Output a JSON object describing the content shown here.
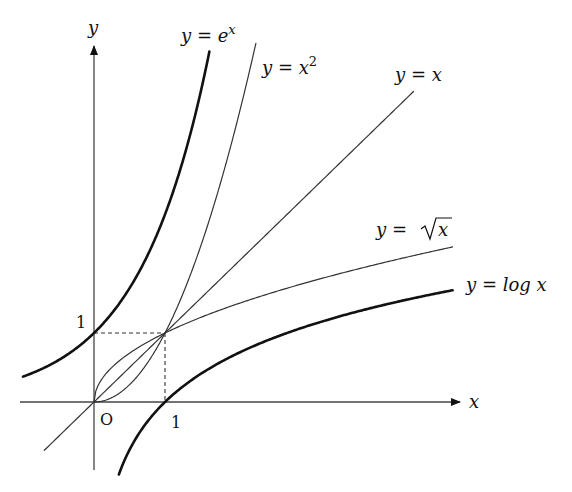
{
  "diagram": {
    "colors": {
      "axis": "#444444",
      "thick_curve": "#111111",
      "thin_curve": "#333333",
      "background": "#ffffff"
    },
    "axes": {
      "x_label": "x",
      "y_label": "y",
      "origin_label": "O",
      "x_tick_label": "1",
      "y_tick_label": "1"
    },
    "curves": [
      {
        "id": "exp",
        "label_main": "y = e",
        "label_sup": "x",
        "weight": "thick"
      },
      {
        "id": "square",
        "label_main": "y = x",
        "label_sup": "2",
        "weight": "thin"
      },
      {
        "id": "identity",
        "label_main": "y = x",
        "label_sup": "",
        "weight": "thin"
      },
      {
        "id": "sqrt",
        "label_main": "y = ",
        "label_rad": "x",
        "weight": "thin"
      },
      {
        "id": "log",
        "label_main": "y = log x",
        "label_sup": "",
        "weight": "thick"
      }
    ],
    "guides": {
      "style": "dashed",
      "point": "(1, 1)"
    }
  },
  "chart_data": {
    "type": "line",
    "title": "",
    "xlabel": "x",
    "ylabel": "y",
    "xlim": [
      -1.0,
      5.2
    ],
    "ylim": [
      -1.3,
      5.4
    ],
    "grid": false,
    "series": [
      {
        "name": "y = e^x",
        "x": [
          -1.0,
          -0.5,
          0,
          0.5,
          1.0,
          1.5
        ],
        "values": [
          0.37,
          0.61,
          1.0,
          1.65,
          2.72,
          4.48
        ]
      },
      {
        "name": "y = x^2",
        "x": [
          0,
          0.5,
          1.0,
          1.5,
          2.0,
          2.3
        ],
        "values": [
          0,
          0.25,
          1.0,
          2.25,
          4.0,
          5.29
        ]
      },
      {
        "name": "y = x",
        "x": [
          -0.7,
          0,
          1.0,
          2.0,
          3.0,
          4.5
        ],
        "values": [
          -0.7,
          0,
          1.0,
          2.0,
          3.0,
          4.5
        ]
      },
      {
        "name": "y = sqrt(x)",
        "x": [
          0,
          0.25,
          1.0,
          2.0,
          3.0,
          4.0,
          5.0
        ],
        "values": [
          0,
          0.5,
          1.0,
          1.41,
          1.73,
          2.0,
          2.24
        ]
      },
      {
        "name": "y = log x",
        "x": [
          0.35,
          0.5,
          1.0,
          2.0,
          3.0,
          4.0,
          5.0
        ],
        "values": [
          -1.05,
          -0.69,
          0,
          0.69,
          1.1,
          1.39,
          1.61
        ]
      }
    ],
    "annotations": [
      "O",
      "1 (x-axis)",
      "1 (y-axis)",
      "dashed lines to point (1,1)"
    ]
  }
}
